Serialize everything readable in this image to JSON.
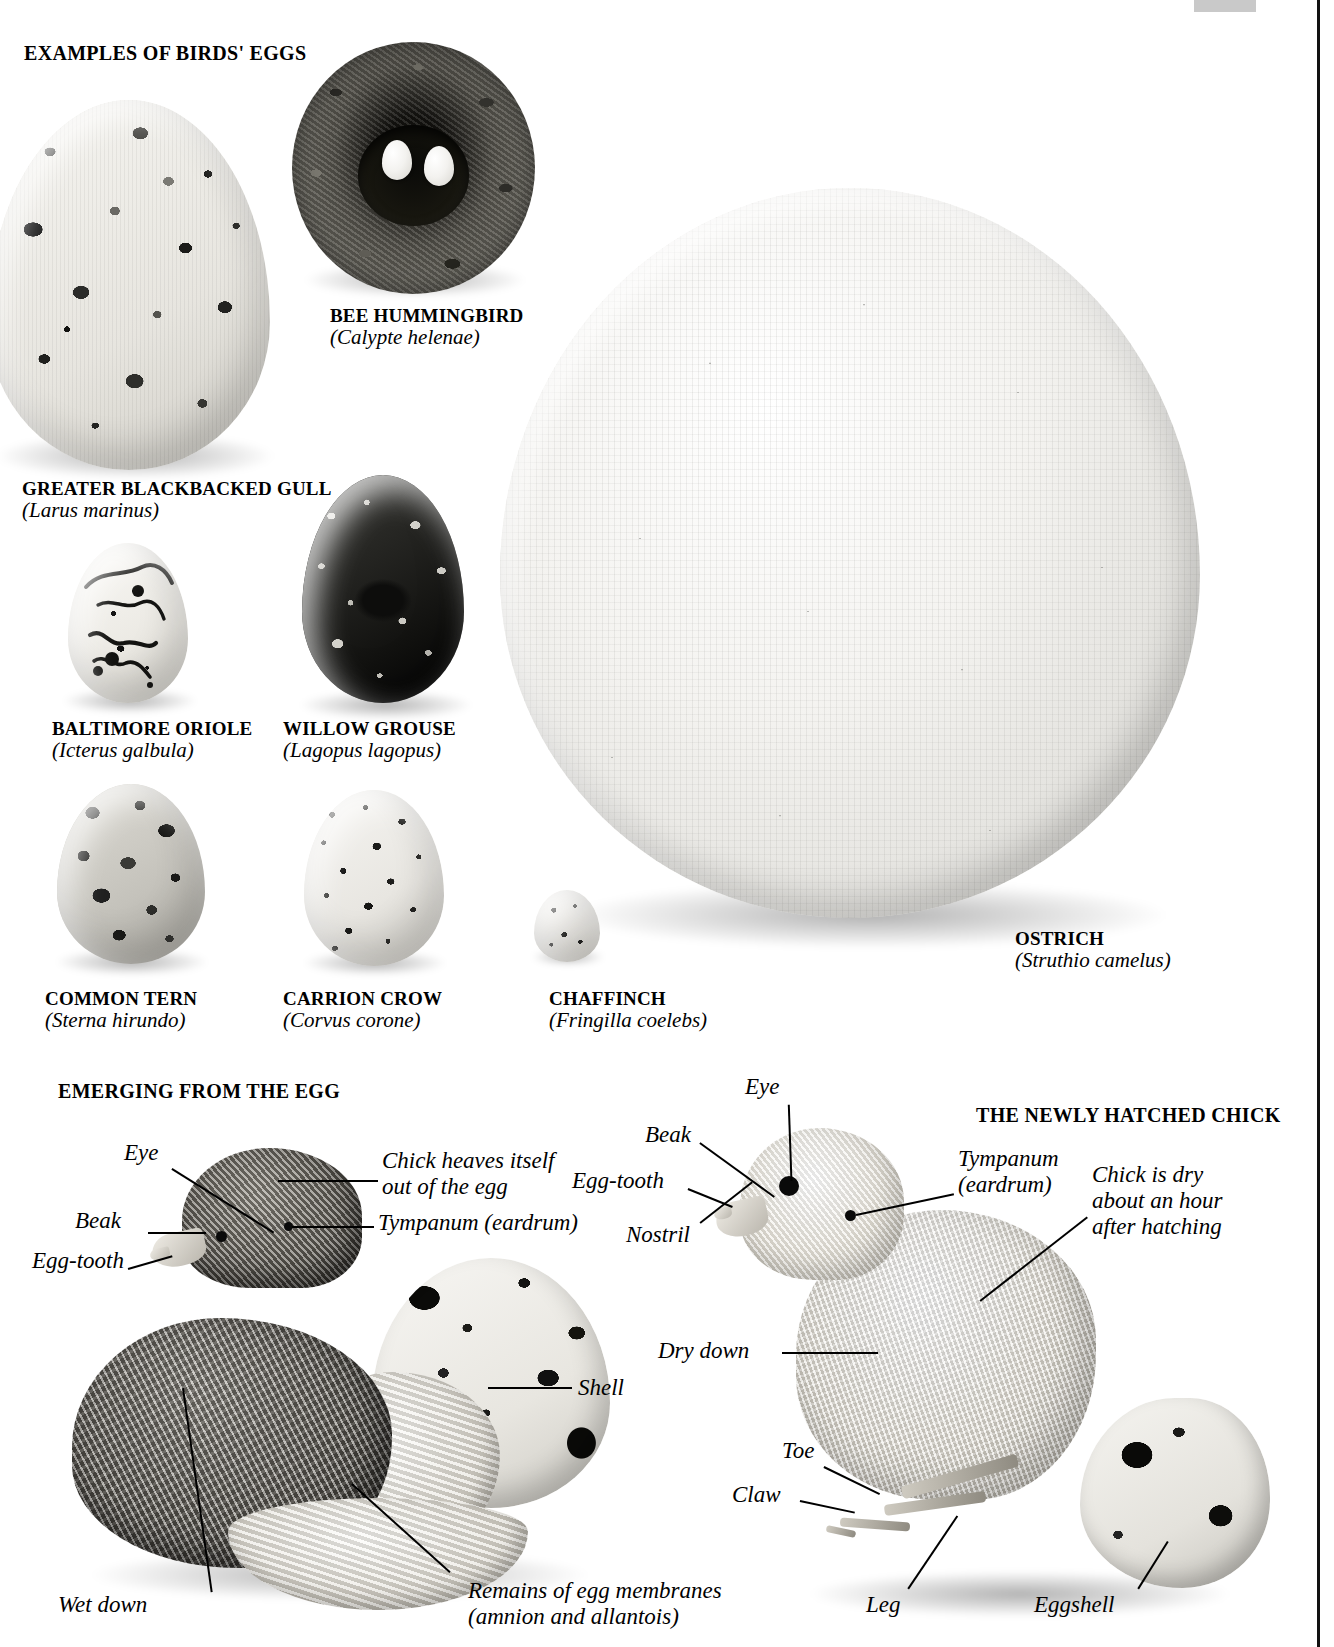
{
  "page": {
    "title": "Examples of Birds' Eggs",
    "width": 1334,
    "height": 1647
  },
  "sections": {
    "eggs_title": "EXAMPLES OF BIRDS' EGGS",
    "emerging_title": "EMERGING FROM THE EGG",
    "hatched_title": "THE NEWLY HATCHED CHICK"
  },
  "eggs": [
    {
      "id": "greater-blackbacked-gull",
      "common": "GREATER BLACKBACKED GULL",
      "latin": "(Larus marinus)"
    },
    {
      "id": "bee-hummingbird",
      "common": "BEE HUMMINGBIRD",
      "latin": "(Calypte helenae)"
    },
    {
      "id": "baltimore-oriole",
      "common": "BALTIMORE ORIOLE",
      "latin": "(Icterus galbula)"
    },
    {
      "id": "willow-grouse",
      "common": "WILLOW GROUSE",
      "latin": "(Lagopus lagopus)"
    },
    {
      "id": "common-tern",
      "common": "COMMON TERN",
      "latin": "(Sterna hirundo)"
    },
    {
      "id": "carrion-crow",
      "common": "CARRION CROW",
      "latin": "(Corvus corone)"
    },
    {
      "id": "chaffinch",
      "common": "CHAFFINCH",
      "latin": "(Fringilla coelebs)"
    },
    {
      "id": "ostrich",
      "common": "OSTRICH",
      "latin": "(Struthio camelus)"
    }
  ],
  "emerging_labels": {
    "eye": "Eye",
    "beak": "Beak",
    "egg_tooth": "Egg-tooth",
    "heaves": "Chick heaves itself\nout of the egg",
    "tympanum": "Tympanum (eardrum)",
    "shell": "Shell",
    "wet_down": "Wet down",
    "membranes": "Remains of egg membranes\n(amnion and allantois)"
  },
  "hatched_labels": {
    "eye": "Eye",
    "beak": "Beak",
    "egg_tooth": "Egg-tooth",
    "nostril": "Nostril",
    "tympanum": "Tympanum\n(eardrum)",
    "dry_note": "Chick is dry\nabout an hour\nafter hatching",
    "dry_down": "Dry down",
    "toe": "Toe",
    "claw": "Claw",
    "leg": "Leg",
    "eggshell": "Eggshell"
  }
}
